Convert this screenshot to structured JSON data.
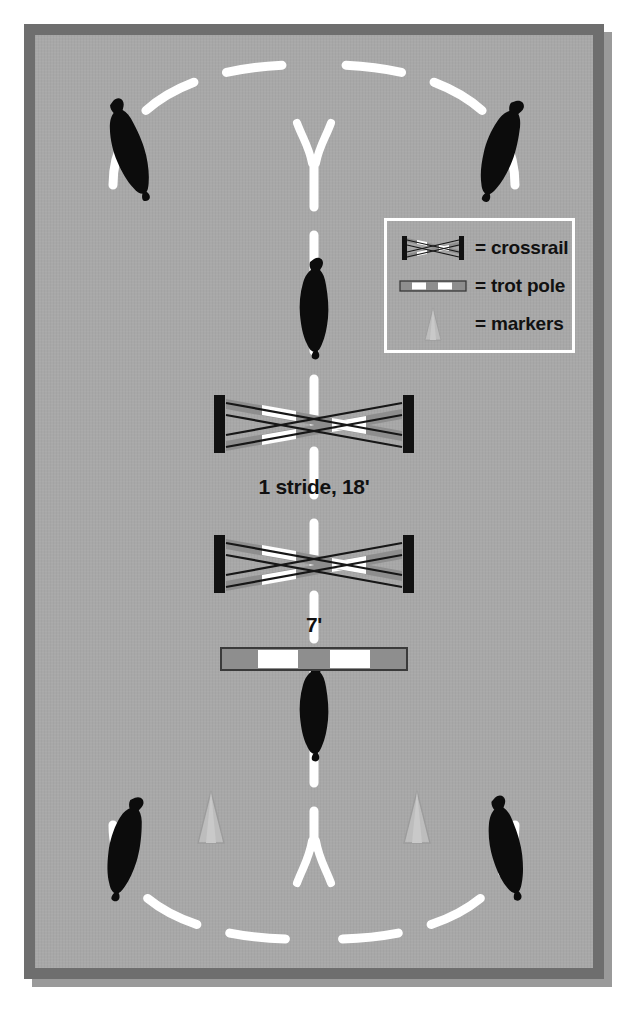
{
  "diagram": {
    "surface_color": "#a8a8a8",
    "frame_color": "#6e6e6e",
    "path_color": "#ffffff",
    "rail_dark": "#141414",
    "rail_gray": "#8e8e8e",
    "rail_white": "#ffffff",
    "marker_color": "#bdbdbd"
  },
  "legend": {
    "items": [
      {
        "symbol": "crossrail-icon",
        "equals": "=",
        "label": "= crossrail"
      },
      {
        "symbol": "trot-pole-icon",
        "equals": "=",
        "label": "= trot pole"
      },
      {
        "symbol": "marker-cone-icon",
        "equals": "=",
        "label": "= markers"
      }
    ]
  },
  "labels": {
    "stride": "1 stride, 18'",
    "seven": "7'"
  },
  "obstacles": [
    {
      "name": "crossrail-upper",
      "type": "crossrail",
      "y": 354
    },
    {
      "name": "crossrail-lower",
      "type": "crossrail",
      "y": 495
    },
    {
      "name": "trot-pole",
      "type": "trot pole",
      "y": 587
    }
  ],
  "riders": [
    {
      "name": "rider-top-left",
      "position": "top-left"
    },
    {
      "name": "rider-top-right",
      "position": "top-right"
    },
    {
      "name": "rider-center-upper",
      "position": "center-upper"
    },
    {
      "name": "rider-center-lower",
      "position": "center-lower"
    },
    {
      "name": "rider-bottom-left",
      "position": "bottom-left"
    },
    {
      "name": "rider-bottom-right",
      "position": "bottom-right"
    }
  ],
  "markers": [
    {
      "name": "marker-left",
      "position": "bottom-left-of-center"
    },
    {
      "name": "marker-right",
      "position": "bottom-right-of-center"
    }
  ],
  "caption": ""
}
